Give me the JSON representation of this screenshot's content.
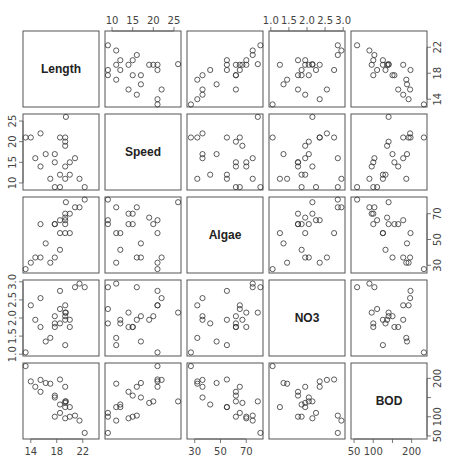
{
  "chart_data": {
    "type": "scatter",
    "subtype": "scatterplot-matrix",
    "title": "",
    "variables": [
      "Length",
      "Speed",
      "Algae",
      "NO3",
      "BOD"
    ],
    "ranges": {
      "Length": [
        12.8,
        24.5
      ],
      "Speed": [
        8.3,
        26.7
      ],
      "Algae": [
        24,
        83
      ],
      "NO3": [
        0.95,
        3.05
      ],
      "BOD": [
        42,
        240
      ]
    },
    "ticks": {
      "Length": [
        14,
        18,
        22
      ],
      "Speed": [
        10,
        15,
        20,
        25
      ],
      "Algae": [
        30,
        50,
        70
      ],
      "NO3": [
        1.0,
        1.5,
        2.0,
        2.5,
        3.0
      ],
      "BOD": [
        50,
        100,
        150,
        200
      ]
    },
    "tick_labels": {
      "Length": [
        "14",
        "18",
        "22"
      ],
      "Speed": [
        "10",
        "15",
        "20",
        "25"
      ],
      "Algae": [
        "30",
        "50",
        "70"
      ],
      "NO3": [
        "1.0",
        "1.5",
        "2.0",
        "2.5",
        "3.0"
      ],
      "BOD": [
        "50",
        "100",
        "",
        "200"
      ]
    },
    "axis_placement": {
      "Length": "bottom,right",
      "Speed": "top,left",
      "Algae": "bottom,right",
      "NO3": "top,left",
      "BOD": "bottom,right"
    },
    "observations": [
      {
        "Length": 13.2,
        "Speed": 21,
        "Algae": 27,
        "NO3": 1.05,
        "BOD": 232
      },
      {
        "Length": 14.0,
        "Speed": 21,
        "Algae": 32,
        "NO3": 2.35,
        "BOD": 192
      },
      {
        "Length": 14.7,
        "Speed": 16,
        "Algae": 36,
        "NO3": 1.95,
        "BOD": 178
      },
      {
        "Length": 15.5,
        "Speed": 22,
        "Algae": 36,
        "NO3": 2.55,
        "BOD": 196
      },
      {
        "Length": 15.5,
        "Speed": 14,
        "Algae": 62,
        "NO3": 1.75,
        "BOD": 165
      },
      {
        "Length": 16.3,
        "Speed": 17,
        "Algae": 47,
        "NO3": 1.35,
        "BOD": 188
      },
      {
        "Length": 17.0,
        "Speed": 11,
        "Algae": 32,
        "NO3": 1.45,
        "BOD": 186
      },
      {
        "Length": 17.7,
        "Speed": 17,
        "Algae": 36,
        "NO3": 2.05,
        "BOD": 150
      },
      {
        "Length": 17.7,
        "Speed": 15,
        "Algae": 62,
        "NO3": 1.75,
        "BOD": 155
      },
      {
        "Length": 17.7,
        "Speed": 9,
        "Algae": 62,
        "NO3": 1.85,
        "BOD": 100
      },
      {
        "Length": 18.5,
        "Speed": 21,
        "Algae": 55,
        "NO3": 2.75,
        "BOD": 197
      },
      {
        "Length": 18.5,
        "Speed": 12,
        "Algae": 42,
        "NO3": 1.85,
        "BOD": 132
      },
      {
        "Length": 18.5,
        "Speed": 9,
        "Algae": 65,
        "NO3": 2.25,
        "BOD": 110
      },
      {
        "Length": 19.3,
        "Speed": 21,
        "Algae": 65,
        "NO3": 2.35,
        "BOD": 178
      },
      {
        "Length": 19.3,
        "Speed": 20,
        "Algae": 62,
        "NO3": 2.05,
        "BOD": 140
      },
      {
        "Length": 19.3,
        "Speed": 19,
        "Algae": 67,
        "NO3": 1.95,
        "BOD": 136
      },
      {
        "Length": 19.3,
        "Speed": 14,
        "Algae": 70,
        "NO3": 2.15,
        "BOD": 96
      },
      {
        "Length": 19.3,
        "Speed": 11,
        "Algae": 55,
        "NO3": 1.25,
        "BOD": 125
      },
      {
        "Length": 19.4,
        "Speed": 26,
        "Algae": 79,
        "NO3": 2.15,
        "BOD": 140
      },
      {
        "Length": 20.0,
        "Speed": 15,
        "Algae": 70,
        "NO3": 1.75,
        "BOD": 100
      },
      {
        "Length": 20.0,
        "Speed": 12,
        "Algae": 55,
        "NO3": 1.95,
        "BOD": 125
      },
      {
        "Length": 20.8,
        "Speed": 16,
        "Algae": 75,
        "NO3": 2.85,
        "BOD": 103
      },
      {
        "Length": 21.5,
        "Speed": 11,
        "Algae": 75,
        "NO3": 2.95,
        "BOD": 90
      },
      {
        "Length": 22.3,
        "Speed": 9,
        "Algae": 81,
        "NO3": 2.85,
        "BOD": 58
      }
    ],
    "grid": false,
    "legend": "none"
  },
  "layout": {
    "panel_left": [
      23,
      105,
      187,
      269,
      351
    ],
    "panel_top": [
      31,
      114,
      197,
      280,
      363
    ],
    "panel_size": 76,
    "point_radius": 2.6,
    "point_color": "#333333",
    "frame_color": "#555555"
  }
}
